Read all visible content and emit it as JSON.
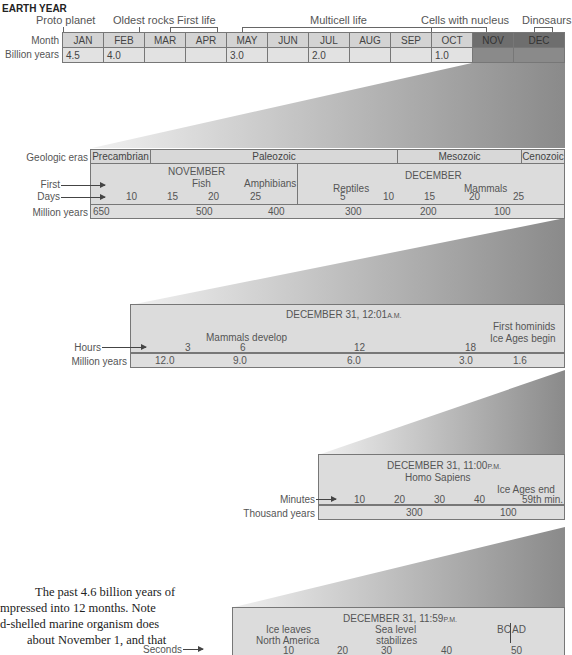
{
  "title": "EARTH YEAR",
  "year_row": {
    "events": [
      {
        "label": "Proto planet"
      },
      {
        "label": "Oldest rocks"
      },
      {
        "label": "First life"
      },
      {
        "label": "Multicell life"
      },
      {
        "label": "Cells with nucleus"
      },
      {
        "label": "Dinosaurs"
      }
    ],
    "month_label": "Month",
    "billion_label": "Billion years",
    "months": [
      "JAN",
      "FEB",
      "MAR",
      "APR",
      "MAY",
      "JUN",
      "JUL",
      "AUG",
      "SEP",
      "OCT",
      "NOV",
      "DEC"
    ],
    "billion_values": [
      "4.5",
      "4.0",
      "",
      "",
      "3.0",
      "",
      "2.0",
      "",
      "",
      "1.0",
      "",
      ""
    ]
  },
  "nov_dec_panel": {
    "eras_label": "Geologic eras",
    "eras": [
      "Precambrian",
      "Paleozoic",
      "Mesozoic",
      "Cenozoic"
    ],
    "first_label": "First",
    "days_label": "Days",
    "million_label": "Million years",
    "november": "NOVEMBER",
    "december": "DECEMBER",
    "events": [
      "Fish",
      "Amphibians",
      "Reptiles",
      "Mammals"
    ],
    "days": [
      "10",
      "15",
      "20",
      "25",
      "5",
      "10",
      "15",
      "20",
      "25"
    ],
    "million_values": [
      "650",
      "500",
      "400",
      "300",
      "200",
      "100"
    ]
  },
  "dec31_hours_panel": {
    "heading": "DECEMBER 31, 12:01",
    "heading_suffix": "A.M.",
    "hours_label": "Hours",
    "million_label": "Million years",
    "events": [
      "Mammals develop",
      "First hominids",
      "Ice Ages begin"
    ],
    "hours": [
      "3",
      "6",
      "12",
      "18"
    ],
    "million_values": [
      "12.0",
      "9.0",
      "6.0",
      "3.0",
      "1.6"
    ]
  },
  "dec31_minutes_panel": {
    "heading": "DECEMBER 31, 11:00",
    "heading_suffix": "P.M.",
    "subheading": "Homo Sapiens",
    "minutes_label": "Minutes",
    "thousand_label": "Thousand years",
    "events": [
      "Ice Ages end",
      "59th min."
    ],
    "minutes": [
      "10",
      "20",
      "30",
      "40"
    ],
    "thousand_values": [
      "300",
      "100"
    ]
  },
  "dec31_seconds_panel": {
    "heading": "DECEMBER 31, 11:59",
    "heading_suffix": "P.M.",
    "seconds_label": "Seconds",
    "events": [
      "Ice leaves",
      "North America",
      "Sea level",
      "stabilizes",
      "BC",
      "AD"
    ],
    "seconds": [
      "10",
      "20",
      "30",
      "40",
      "50"
    ]
  },
  "caption": {
    "lines": [
      "The past 4.6 billion years of",
      "mpressed into 12 months. Note",
      "d-shelled marine organism does",
      "about November 1, and that"
    ]
  }
}
